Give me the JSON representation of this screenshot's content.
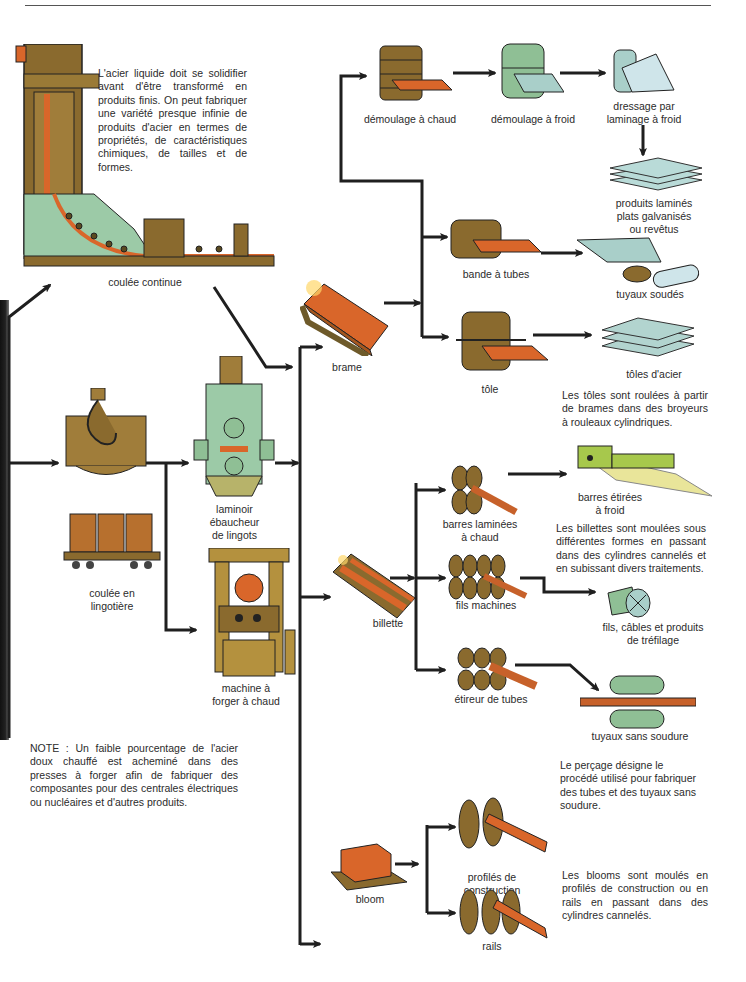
{
  "title_rule": "",
  "intro_text": "L'acier liquide doit se solidifier avant d'être transformé en produits finis. On peut fabriquer une variété presque infinie de produits d'acier en termes de propriétés, de caractéristiques chimiques, de tailles et de formes.",
  "nodes": {
    "coulee_continue": "coulée continue",
    "coulee_lingotiere": "coulée en\nlingotière",
    "laminoir": "laminoir\nébaucheur\nde lingots",
    "machine_forger": "machine à\nforger à chaud",
    "brame": "brame",
    "billette": "billette",
    "bloom": "bloom",
    "demoulage_chaud": "démoulage à chaud",
    "demoulage_froid": "démoulage à froid",
    "dressage": "dressage par\nlaminage à froid",
    "produits_lamines": "produits laminés\nplats galvanisés\nou revêtus",
    "bande_tubes": "bande à tubes",
    "tuyaux_soudes": "tuyaux soudés",
    "tole": "tôle",
    "toles_acier": "tôles d'acier",
    "barres_laminees": "barres laminées\nà chaud",
    "barres_etirees": "barres étirées\nà froid",
    "fils_machines": "fils machines",
    "fils_cables": "fils, câbles et produits\nde tréfilage",
    "etireur": "étireur de tubes",
    "tuyaux_sans_soudure": "tuyaux sans soudure",
    "profiles": "profilés de\nconstruction",
    "rails": "rails"
  },
  "notes": {
    "toles": "Les tôles sont roulées à partir de brames dans des broyeurs à rouleaux cylindriques.",
    "billettes": "Les billettes sont moulées sous différentes formes en passant dans des cylindres cannelés et en subissant divers traitements.",
    "percage": "Le perçage désigne le procédé utilisé pour fabriquer des tubes et des tuyaux sans soudure.",
    "blooms": "Les blooms sont moulés en profilés de construction ou en rails en passant dans des cylindres cannelés.",
    "note_forge": "NOTE : Un faible pourcentage de l'acier doux chauffé est acheminé dans des presses à forger afin de fabriquer des composantes pour des centrales électriques ou nucléaires et d'autres produits."
  },
  "colors": {
    "arrow": "#1f1f1f",
    "hot_steel": "#d9662a",
    "machine_brown": "#8a6a2e",
    "machine_green": "#8fbf95",
    "cold_steel": "#a9cfc9"
  }
}
